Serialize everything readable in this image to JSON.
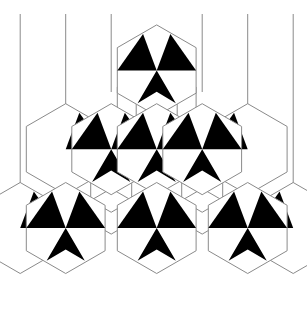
{
  "figure": {
    "kind": "geometric-line-art",
    "width": 307,
    "height": 324,
    "background_color": "#ffffff",
    "ink_color": "#000000",
    "line_color": "#8a8a8a",
    "line_width": 1
  },
  "geometry": {
    "hex_circumradius": 45.5,
    "hex_apothem": 39.4,
    "hex_orientation": "pointy-top",
    "column_pitch": 45.5,
    "row_pitch": 78.8,
    "inner_cube_scale": 0.5
  },
  "guide_lines": {
    "label": "vertical guide lines",
    "count": 6,
    "stroke": "#8a8a8a",
    "x_positions": [
      20.2,
      65.7,
      111.2,
      202.2,
      247.7,
      293.2
    ],
    "y_top": 14,
    "y_bottom_by_index": [
      250,
      170,
      92,
      92,
      170,
      250
    ]
  },
  "tiles": {
    "pinwheel_label": "pinwheel hexagon",
    "cube_label": "tumbling block hexagon",
    "pinwheel_centers": [
      {
        "cx": 156.7,
        "cy": 70.4,
        "row": 1,
        "col": 1
      },
      {
        "cx": 111.2,
        "cy": 149.2,
        "row": 2,
        "col": 1
      },
      {
        "cx": 156.7,
        "cy": 149.2,
        "row": 2,
        "col": 2
      },
      {
        "cx": 202.2,
        "cy": 149.2,
        "row": 2,
        "col": 3
      },
      {
        "cx": 65.7,
        "cy": 228.0,
        "row": 3,
        "col": 1
      },
      {
        "cx": 156.7,
        "cy": 228.0,
        "row": 3,
        "col": 2
      },
      {
        "cx": 247.7,
        "cy": 228.0,
        "row": 3,
        "col": 3
      }
    ],
    "cube_centers": [
      {
        "cx": 156.7,
        "cy": 109.8,
        "row": 1.5,
        "col": 1
      },
      {
        "cx": 111.2,
        "cy": 188.6,
        "row": 2.5,
        "col": 1
      },
      {
        "cx": 202.2,
        "cy": 188.6,
        "row": 2.5,
        "col": 2
      }
    ],
    "half_hex_fans": [
      {
        "cx": 65.7,
        "cy": 149.2,
        "side": "left"
      },
      {
        "cx": 247.7,
        "cy": 149.2,
        "side": "right"
      },
      {
        "cx": 20.2,
        "cy": 228.0,
        "side": "left"
      },
      {
        "cx": 293.2,
        "cy": 228.0,
        "side": "right"
      }
    ]
  },
  "legend": {
    "pinwheel_description": "three black triangular blades radiating from hexagon centre",
    "cube_description": "inner hexagon split into three rhombi forming an isometric cube"
  }
}
